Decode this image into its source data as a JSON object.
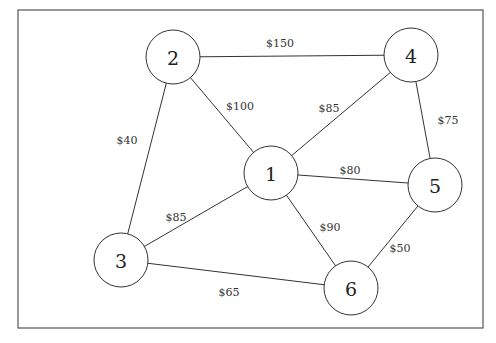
{
  "diagram": {
    "type": "weighted-undirected-graph",
    "frame": {
      "x": 18,
      "y": 10,
      "width": 465,
      "height": 318
    },
    "nodes": [
      {
        "id": "1",
        "label": "1",
        "x": 271,
        "y": 173,
        "r": 27
      },
      {
        "id": "2",
        "label": "2",
        "x": 173,
        "y": 57,
        "r": 27
      },
      {
        "id": "3",
        "label": "3",
        "x": 121,
        "y": 260,
        "r": 27
      },
      {
        "id": "4",
        "label": "4",
        "x": 411,
        "y": 55,
        "r": 27
      },
      {
        "id": "5",
        "label": "5",
        "x": 435,
        "y": 185,
        "r": 27
      },
      {
        "id": "6",
        "label": "6",
        "x": 351,
        "y": 288,
        "r": 27
      }
    ],
    "edges": [
      {
        "from": "2",
        "to": "4",
        "weight": "$150",
        "lx": 280,
        "ly": 43
      },
      {
        "from": "2",
        "to": "1",
        "weight": "$100",
        "lx": 240,
        "ly": 106
      },
      {
        "from": "2",
        "to": "3",
        "weight": "$40",
        "lx": 127,
        "ly": 140
      },
      {
        "from": "4",
        "to": "1",
        "weight": "$85",
        "lx": 329,
        "ly": 108
      },
      {
        "from": "4",
        "to": "5",
        "weight": "$75",
        "lx": 448,
        "ly": 120
      },
      {
        "from": "1",
        "to": "5",
        "weight": "$80",
        "lx": 350,
        "ly": 170
      },
      {
        "from": "1",
        "to": "6",
        "weight": "$90",
        "lx": 330,
        "ly": 227
      },
      {
        "from": "1",
        "to": "3",
        "weight": "$85",
        "lx": 176,
        "ly": 217
      },
      {
        "from": "5",
        "to": "6",
        "weight": "$50",
        "lx": 400,
        "ly": 248
      },
      {
        "from": "3",
        "to": "6",
        "weight": "$65",
        "lx": 229,
        "ly": 292
      }
    ]
  }
}
